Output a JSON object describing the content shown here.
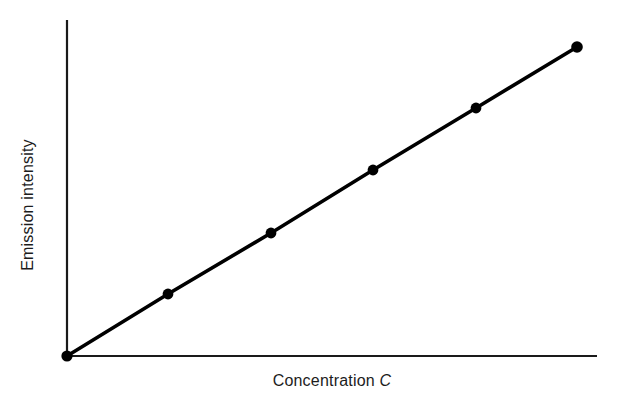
{
  "figure": {
    "width": 622,
    "height": 409,
    "background_color": "#ffffff"
  },
  "axes": {
    "x_label_text": "Concentration",
    "x_label_symbol": "C",
    "y_label": "Emission intensity",
    "axis_color": "#1a1a1a",
    "has_tick_marks": false,
    "has_tick_labels": false,
    "has_gridlines": false,
    "x_axis_pixel": {
      "x1": 67,
      "y1": 356,
      "x2": 597,
      "y2": 356
    },
    "y_axis_pixel": {
      "x1": 67,
      "y1": 20,
      "x2": 67,
      "y2": 356
    }
  },
  "chart_data": {
    "type": "line",
    "title": "",
    "subtitle": "",
    "xlabel": "Concentration C",
    "ylabel": "Emission intensity",
    "legend": [],
    "legend_position": "none",
    "grid": false,
    "xlim": [
      0,
      6
    ],
    "ylim": [
      0,
      6
    ],
    "x_tick_labels": [],
    "y_tick_labels": [],
    "annotations": [],
    "series": [
      {
        "name": "Emission intensity vs concentration",
        "line_color": "#000000",
        "marker": "filled-circle",
        "marker_color": "#000000",
        "x": [
          0,
          1,
          2,
          3,
          4,
          5
        ],
        "y": [
          0,
          1,
          2,
          3,
          4,
          5
        ],
        "points_pixel": [
          {
            "x": 67,
            "y": 356
          },
          {
            "x": 168,
            "y": 294
          },
          {
            "x": 271,
            "y": 233
          },
          {
            "x": 373,
            "y": 170
          },
          {
            "x": 476,
            "y": 108
          },
          {
            "x": 577,
            "y": 47
          }
        ]
      }
    ]
  }
}
